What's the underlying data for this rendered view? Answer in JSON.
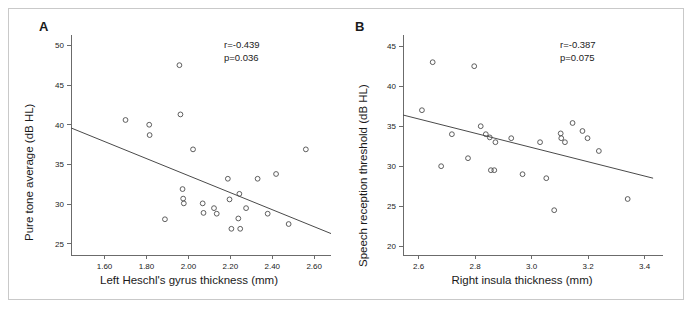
{
  "figure": {
    "background_color": "#ffffff",
    "frame_color": "#c9c9c9",
    "marker_color": "#4d4d4d",
    "line_color": "#4a4a4a",
    "axis_color": "#6b6b6b"
  },
  "panels": {
    "a": {
      "letter": "A",
      "r_text": "r=-0.439",
      "p_text": "p=0.036"
    },
    "b": {
      "letter": "B",
      "r_text": "r=-0.387",
      "p_text": "p=0.075"
    }
  },
  "chart_data": [
    {
      "type": "scatter",
      "panel": "A",
      "title": "",
      "xlabel": "Left Heschl's gyrus thickness (mm)",
      "ylabel": "Pure tone average (dB HL)",
      "xlim": [
        1.44,
        2.68
      ],
      "ylim": [
        23.6,
        51.3
      ],
      "xticks": [
        1.6,
        1.8,
        2.0,
        2.2,
        2.4,
        2.6
      ],
      "xticklabels": [
        "1.60",
        "1.80",
        "2.00",
        "2.20",
        "2.40",
        "2.60"
      ],
      "yticks": [
        25,
        30,
        35,
        40,
        45,
        50
      ],
      "yticklabels": [
        "25",
        "30",
        "35",
        "40",
        "45",
        "50"
      ],
      "grid": false,
      "legend": null,
      "annotations": [
        "r=-0.439",
        "p=0.036"
      ],
      "regression_line": {
        "x": [
          1.44,
          2.68
        ],
        "y": [
          39.6,
          26.3
        ]
      },
      "points": [
        {
          "x": 1.7,
          "y": 40.6
        },
        {
          "x": 1.813,
          "y": 40.0
        },
        {
          "x": 1.815,
          "y": 38.7
        },
        {
          "x": 1.888,
          "y": 28.1
        },
        {
          "x": 1.957,
          "y": 47.5
        },
        {
          "x": 1.962,
          "y": 41.3
        },
        {
          "x": 1.972,
          "y": 31.9
        },
        {
          "x": 1.975,
          "y": 30.7
        },
        {
          "x": 1.978,
          "y": 30.1
        },
        {
          "x": 2.022,
          "y": 36.9
        },
        {
          "x": 2.068,
          "y": 30.1
        },
        {
          "x": 2.072,
          "y": 28.9
        },
        {
          "x": 2.122,
          "y": 29.5
        },
        {
          "x": 2.135,
          "y": 28.8
        },
        {
          "x": 2.188,
          "y": 33.2
        },
        {
          "x": 2.196,
          "y": 30.6
        },
        {
          "x": 2.205,
          "y": 26.9
        },
        {
          "x": 2.238,
          "y": 28.2
        },
        {
          "x": 2.243,
          "y": 31.3
        },
        {
          "x": 2.247,
          "y": 26.9
        },
        {
          "x": 2.275,
          "y": 29.5
        },
        {
          "x": 2.33,
          "y": 33.2
        },
        {
          "x": 2.378,
          "y": 28.8
        },
        {
          "x": 2.418,
          "y": 33.8
        },
        {
          "x": 2.478,
          "y": 27.5
        },
        {
          "x": 2.56,
          "y": 36.9
        }
      ]
    },
    {
      "type": "scatter",
      "panel": "B",
      "title": "",
      "xlabel": "Right insula thickness (mm)",
      "ylabel": "Speech reception threshold (dB HL)",
      "xlim": [
        2.545,
        3.465
      ],
      "ylim": [
        18.9,
        46.4
      ],
      "xticks": [
        2.6,
        2.8,
        3.0,
        3.2,
        3.4
      ],
      "xticklabels": [
        "2.6",
        "2.8",
        "3.0",
        "3.2",
        "3.4"
      ],
      "yticks": [
        20,
        25,
        30,
        35,
        40,
        45
      ],
      "yticklabels": [
        "20",
        "25",
        "30",
        "35",
        "40",
        "45"
      ],
      "grid": false,
      "legend": null,
      "annotations": [
        "r=-0.387",
        "p=0.075"
      ],
      "regression_line": {
        "x": [
          2.545,
          3.43
        ],
        "y": [
          36.4,
          28.5
        ]
      },
      "points": [
        {
          "x": 2.612,
          "y": 37.0
        },
        {
          "x": 2.65,
          "y": 43.0
        },
        {
          "x": 2.68,
          "y": 30.0
        },
        {
          "x": 2.718,
          "y": 34.0
        },
        {
          "x": 2.775,
          "y": 31.0
        },
        {
          "x": 2.797,
          "y": 42.5
        },
        {
          "x": 2.82,
          "y": 35.0
        },
        {
          "x": 2.838,
          "y": 34.0
        },
        {
          "x": 2.852,
          "y": 33.6
        },
        {
          "x": 2.856,
          "y": 29.5
        },
        {
          "x": 2.868,
          "y": 29.5
        },
        {
          "x": 2.872,
          "y": 33.0
        },
        {
          "x": 2.928,
          "y": 33.5
        },
        {
          "x": 2.968,
          "y": 29.0
        },
        {
          "x": 3.03,
          "y": 33.0
        },
        {
          "x": 3.052,
          "y": 28.5
        },
        {
          "x": 3.08,
          "y": 24.5
        },
        {
          "x": 3.103,
          "y": 34.1
        },
        {
          "x": 3.105,
          "y": 33.5
        },
        {
          "x": 3.118,
          "y": 33.0
        },
        {
          "x": 3.145,
          "y": 35.4
        },
        {
          "x": 3.18,
          "y": 34.4
        },
        {
          "x": 3.198,
          "y": 33.5
        },
        {
          "x": 3.238,
          "y": 31.9
        },
        {
          "x": 3.34,
          "y": 25.9
        }
      ]
    }
  ]
}
